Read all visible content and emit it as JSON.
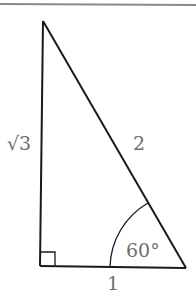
{
  "diagram": {
    "type": "right-triangle",
    "colors": {
      "stroke": "#1a1a1a",
      "label": "#6e6e6e",
      "border": "#8a8a8a"
    },
    "vertices": {
      "top": [
        43,
        21
      ],
      "right_angle": [
        40,
        266
      ],
      "bottom_right": [
        186,
        268
      ]
    },
    "labels": {
      "vertical_side": "√3",
      "hypotenuse": "2",
      "base": "1",
      "angle": "60°"
    },
    "right_angle_marker": true,
    "angle_arc": {
      "vertex": "bottom_right",
      "degrees": 60
    }
  }
}
